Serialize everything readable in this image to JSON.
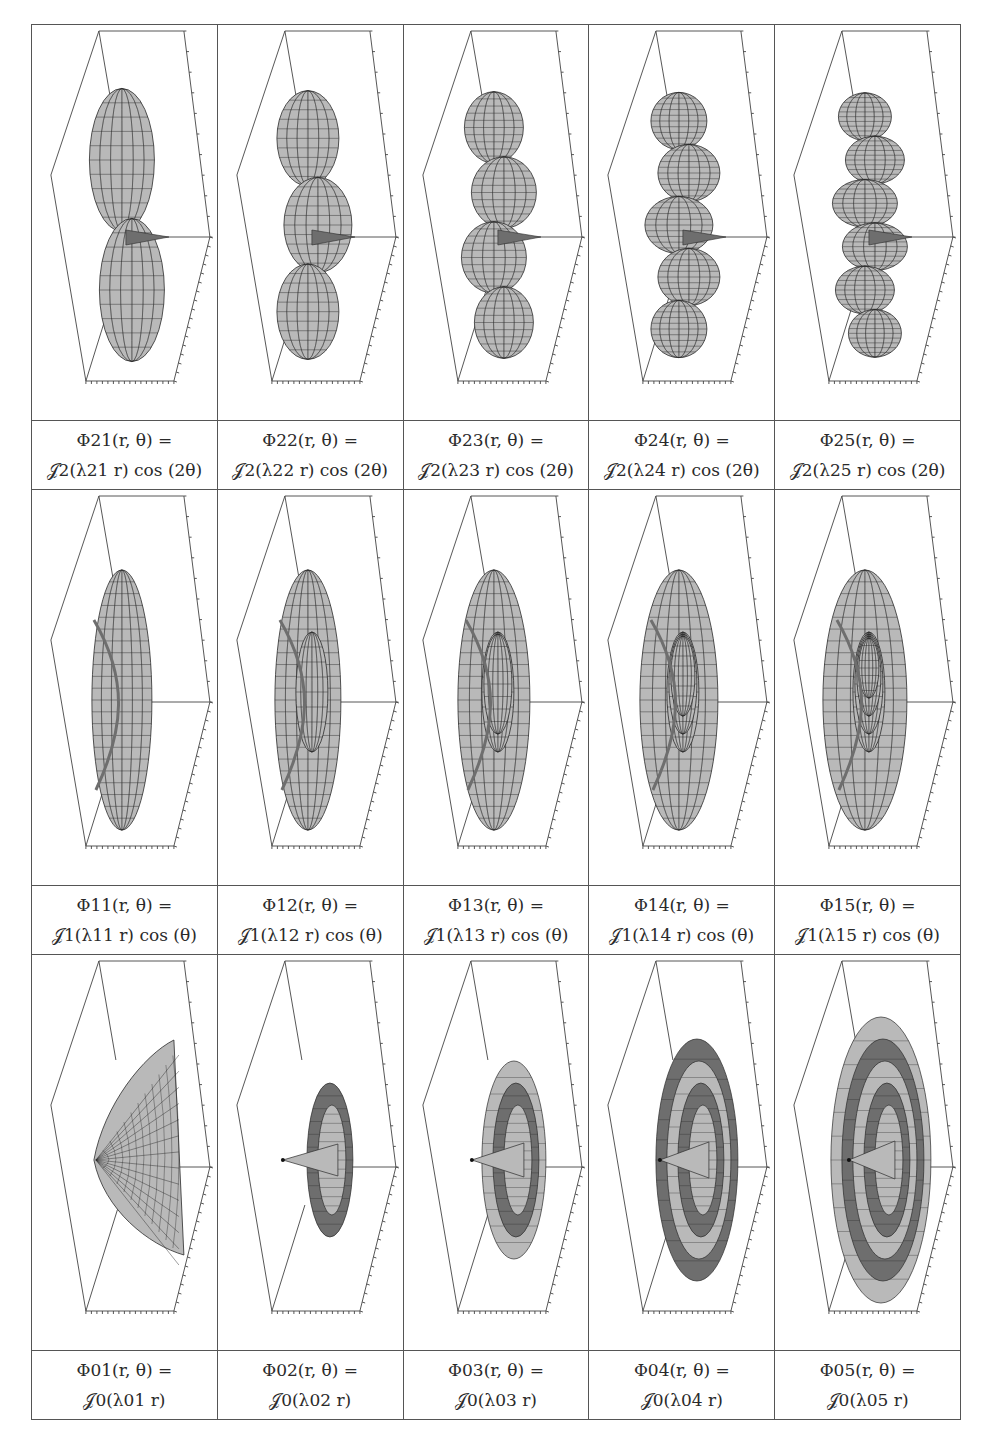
{
  "figure": {
    "rows": [
      {
        "order": 2,
        "angular_factor": "cos (2θ)",
        "cells": [
          {
            "id": "21",
            "line1": "Φ21(r, θ) =",
            "line2": "𝒥2(λ21 r) cos (2θ)",
            "phi_sub": "21",
            "bessel_sub": "2",
            "lambda_sub": "21",
            "trig": " cos (2θ)",
            "shape": "bessel-2-1"
          },
          {
            "id": "22",
            "line1": "Φ22(r, θ) =",
            "line2": "𝒥2(λ22 r) cos (2θ)",
            "phi_sub": "22",
            "bessel_sub": "2",
            "lambda_sub": "22",
            "trig": " cos (2θ)",
            "shape": "bessel-2-2"
          },
          {
            "id": "23",
            "line1": "Φ23(r, θ) =",
            "line2": "𝒥2(λ23 r) cos (2θ)",
            "phi_sub": "23",
            "bessel_sub": "2",
            "lambda_sub": "23",
            "trig": " cos (2θ)",
            "shape": "bessel-2-3"
          },
          {
            "id": "24",
            "line1": "Φ24(r, θ) =",
            "line2": "𝒥2(λ24 r) cos (2θ)",
            "phi_sub": "24",
            "bessel_sub": "2",
            "lambda_sub": "24",
            "trig": " cos (2θ)",
            "shape": "bessel-2-4"
          },
          {
            "id": "25",
            "line1": "Φ25(r, θ) =",
            "line2": "𝒥2(λ25 r) cos (2θ)",
            "phi_sub": "25",
            "bessel_sub": "2",
            "lambda_sub": "25",
            "trig": " cos (2θ)",
            "shape": "bessel-2-5"
          }
        ]
      },
      {
        "order": 1,
        "angular_factor": "cos (θ)",
        "cells": [
          {
            "id": "11",
            "line1": "Φ11(r, θ) =",
            "line2": "𝒥1(λ11 r) cos (θ)",
            "phi_sub": "11",
            "bessel_sub": "1",
            "lambda_sub": "11",
            "trig": " cos (θ)",
            "shape": "bessel-1-1"
          },
          {
            "id": "12",
            "line1": "Φ12(r, θ) =",
            "line2": "𝒥1(λ12 r) cos (θ)",
            "phi_sub": "12",
            "bessel_sub": "1",
            "lambda_sub": "12",
            "trig": " cos (θ)",
            "shape": "bessel-1-2"
          },
          {
            "id": "13",
            "line1": "Φ13(r, θ) =",
            "line2": "𝒥1(λ13 r) cos (θ)",
            "phi_sub": "13",
            "bessel_sub": "1",
            "lambda_sub": "13",
            "trig": " cos (θ)",
            "shape": "bessel-1-3"
          },
          {
            "id": "14",
            "line1": "Φ14(r, θ) =",
            "line2": "𝒥1(λ14 r) cos (θ)",
            "phi_sub": "14",
            "bessel_sub": "1",
            "lambda_sub": "14",
            "trig": " cos (θ)",
            "shape": "bessel-1-4"
          },
          {
            "id": "15",
            "line1": "Φ15(r, θ) =",
            "line2": "𝒥1(λ15 r) cos (θ)",
            "phi_sub": "15",
            "bessel_sub": "1",
            "lambda_sub": "15",
            "trig": " cos (θ)",
            "shape": "bessel-1-5"
          }
        ]
      },
      {
        "order": 0,
        "angular_factor": "",
        "cells": [
          {
            "id": "01",
            "line1": "Φ01(r, θ) =",
            "line2": "𝒥0(λ01 r)",
            "phi_sub": "01",
            "bessel_sub": "0",
            "lambda_sub": "01",
            "trig": "",
            "shape": "bessel-0-1"
          },
          {
            "id": "02",
            "line1": "Φ02(r, θ) =",
            "line2": "𝒥0(λ02 r)",
            "phi_sub": "02",
            "bessel_sub": "0",
            "lambda_sub": "02",
            "trig": "",
            "shape": "bessel-0-2"
          },
          {
            "id": "03",
            "line1": "Φ03(r, θ) =",
            "line2": "𝒥0(λ03 r)",
            "phi_sub": "03",
            "bessel_sub": "0",
            "lambda_sub": "03",
            "trig": "",
            "shape": "bessel-0-3"
          },
          {
            "id": "04",
            "line1": "Φ04(r, θ) =",
            "line2": "𝒥0(λ04 r)",
            "phi_sub": "04",
            "bessel_sub": "0",
            "lambda_sub": "04",
            "trig": "",
            "shape": "bessel-0-4"
          },
          {
            "id": "05",
            "line1": "Φ05(r, θ) =",
            "line2": "𝒥0(λ05 r)",
            "phi_sub": "05",
            "bessel_sub": "0",
            "lambda_sub": "05",
            "trig": "",
            "shape": "bessel-0-5"
          }
        ]
      }
    ],
    "colors": {
      "border": "#555555",
      "surface_fill": "#b9b9b9",
      "surface_dark": "#6e6e6e",
      "mesh": "#2b2b2b",
      "box": "#444444"
    }
  }
}
